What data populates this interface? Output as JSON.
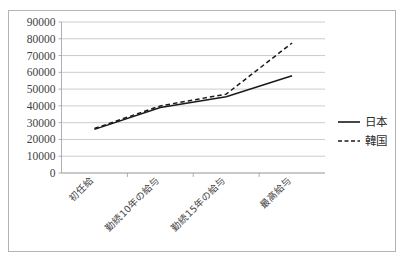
{
  "chart_data": {
    "type": "line",
    "title": "",
    "xlabel": "",
    "ylabel": "",
    "categories": [
      "初任給",
      "勤続10年の給与",
      "勤続15年の給与",
      "最高給与"
    ],
    "series": [
      {
        "name": "日本",
        "values": [
          26000,
          39000,
          45500,
          58000
        ],
        "style": "solid"
      },
      {
        "name": "韓国",
        "values": [
          26500,
          40000,
          47000,
          77500
        ],
        "style": "dashed"
      }
    ],
    "ylim": [
      0,
      90000
    ],
    "ytick_labels": [
      "90000",
      "80000",
      "70000",
      "60000",
      "50000",
      "40000",
      "30000",
      "20000",
      "10000",
      "0"
    ],
    "ytick_values": [
      90000,
      80000,
      70000,
      60000,
      50000,
      40000,
      30000,
      20000,
      10000,
      0
    ],
    "grid": true,
    "legend_position": "right",
    "legend_entries": [
      {
        "label": "日本",
        "style": "solid"
      },
      {
        "label": "韓国",
        "style": "dashed"
      }
    ],
    "line_color": "#1a1a1a",
    "grid_color": "#bfbfbf",
    "border_color": "#b4b4b4",
    "background": "#ffffff"
  }
}
